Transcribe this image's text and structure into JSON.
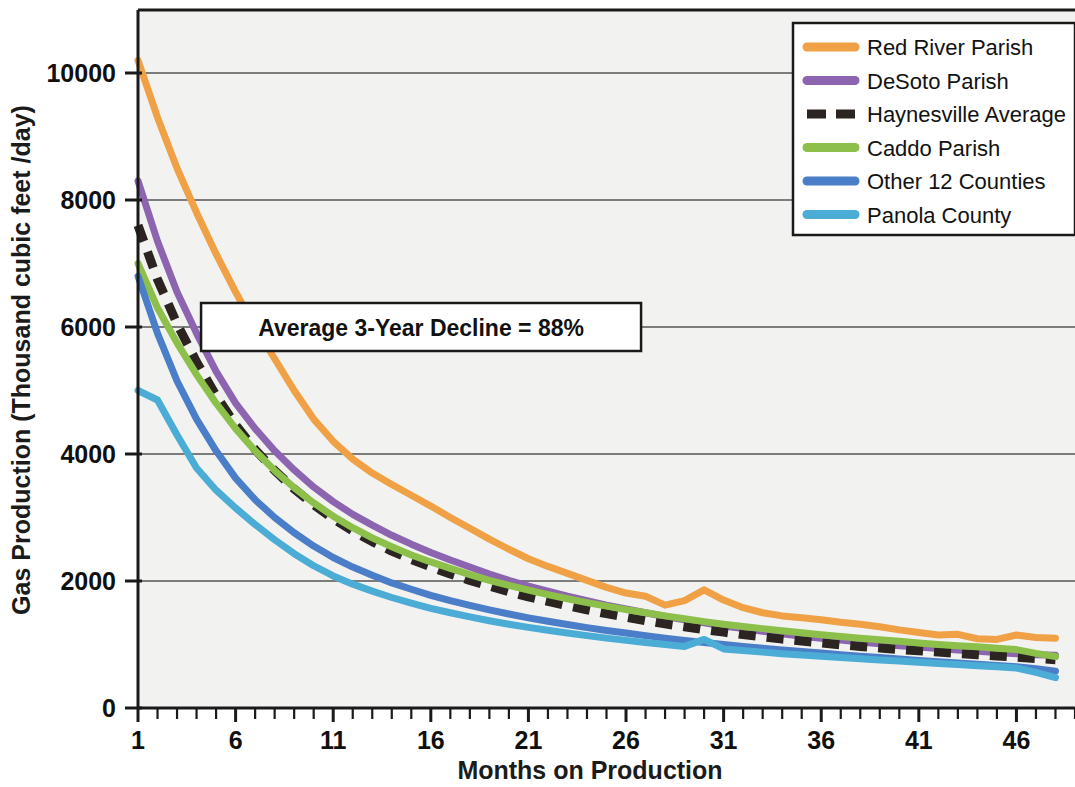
{
  "chart_data": {
    "type": "line",
    "title": "",
    "xlabel": "Months on Production",
    "ylabel": "Gas Production (Thousand cubic feet /day)",
    "xlim": [
      1,
      48
    ],
    "ylim": [
      0,
      10800
    ],
    "xticks": [
      1,
      6,
      11,
      16,
      21,
      26,
      31,
      36,
      41,
      46
    ],
    "xtick_labels": [
      "1",
      "6",
      "11",
      "16",
      "21",
      "26",
      "31",
      "36",
      "41",
      "46"
    ],
    "yticks": [
      0,
      2000,
      4000,
      6000,
      8000,
      10000
    ],
    "ytick_labels": [
      "0",
      "2000",
      "4000",
      "6000",
      "8000",
      "10000"
    ],
    "grid": "horizontal",
    "legend_position": "top-right",
    "x": [
      1,
      2,
      3,
      4,
      5,
      6,
      7,
      8,
      9,
      10,
      11,
      12,
      13,
      14,
      15,
      16,
      17,
      18,
      19,
      20,
      21,
      22,
      23,
      24,
      25,
      26,
      27,
      28,
      29,
      30,
      31,
      32,
      33,
      34,
      35,
      36,
      37,
      38,
      39,
      40,
      41,
      42,
      43,
      44,
      45,
      46,
      47,
      48
    ],
    "series": [
      {
        "name": "Red River Parish",
        "color": "#F0A045",
        "style": "solid",
        "values": [
          10200,
          9300,
          8500,
          7800,
          7150,
          6550,
          6000,
          5500,
          5000,
          4550,
          4200,
          3920,
          3700,
          3520,
          3350,
          3180,
          3000,
          2830,
          2660,
          2500,
          2350,
          2230,
          2120,
          2010,
          1900,
          1810,
          1760,
          1620,
          1690,
          1860,
          1700,
          1580,
          1500,
          1450,
          1420,
          1390,
          1350,
          1320,
          1280,
          1230,
          1190,
          1150,
          1160,
          1090,
          1080,
          1150,
          1110,
          1100
        ]
      },
      {
        "name": "DeSoto Parish",
        "color": "#8C64B0",
        "style": "solid",
        "values": [
          8300,
          7350,
          6550,
          5900,
          5300,
          4800,
          4400,
          4050,
          3750,
          3480,
          3250,
          3050,
          2880,
          2720,
          2580,
          2450,
          2330,
          2220,
          2110,
          2010,
          1920,
          1840,
          1760,
          1690,
          1620,
          1560,
          1500,
          1440,
          1390,
          1340,
          1290,
          1250,
          1210,
          1170,
          1130,
          1100,
          1070,
          1040,
          1010,
          980,
          960,
          935,
          915,
          895,
          875,
          855,
          840,
          830
        ]
      },
      {
        "name": "Haynesville Average",
        "color": "#2B2420",
        "style": "dashed",
        "values": [
          7600,
          6750,
          6050,
          5450,
          4920,
          4460,
          4070,
          3740,
          3450,
          3200,
          2980,
          2790,
          2620,
          2470,
          2340,
          2220,
          2110,
          2010,
          1920,
          1830,
          1750,
          1680,
          1610,
          1545,
          1485,
          1430,
          1375,
          1325,
          1280,
          1235,
          1195,
          1155,
          1120,
          1085,
          1055,
          1025,
          995,
          970,
          945,
          920,
          900,
          880,
          860,
          840,
          820,
          800,
          780,
          760
        ]
      },
      {
        "name": "Caddo Parish",
        "color": "#8CC04A",
        "style": "solid",
        "values": [
          7000,
          6300,
          5750,
          5250,
          4800,
          4400,
          4050,
          3740,
          3470,
          3230,
          3020,
          2840,
          2680,
          2540,
          2410,
          2300,
          2200,
          2100,
          2010,
          1930,
          1855,
          1785,
          1720,
          1660,
          1605,
          1550,
          1500,
          1450,
          1405,
          1360,
          1320,
          1285,
          1250,
          1215,
          1185,
          1155,
          1125,
          1100,
          1075,
          1050,
          1025,
          1000,
          980,
          965,
          940,
          920,
          860,
          810
        ]
      },
      {
        "name": "Other 12 Counties",
        "color": "#4A7EC8",
        "style": "solid",
        "values": [
          6800,
          5900,
          5150,
          4550,
          4050,
          3620,
          3280,
          3000,
          2760,
          2550,
          2370,
          2220,
          2090,
          1970,
          1870,
          1775,
          1690,
          1615,
          1545,
          1480,
          1420,
          1365,
          1315,
          1265,
          1220,
          1180,
          1140,
          1100,
          1065,
          1030,
          1000,
          970,
          940,
          915,
          890,
          865,
          840,
          815,
          795,
          770,
          750,
          730,
          710,
          690,
          670,
          650,
          620,
          580
        ]
      },
      {
        "name": "Panola County",
        "color": "#4BACD6",
        "style": "solid",
        "values": [
          5000,
          4850,
          4300,
          3780,
          3430,
          3150,
          2890,
          2650,
          2430,
          2240,
          2080,
          1950,
          1840,
          1740,
          1650,
          1570,
          1500,
          1435,
          1375,
          1320,
          1270,
          1225,
          1180,
          1140,
          1100,
          1065,
          1030,
          1000,
          970,
          1080,
          930,
          905,
          880,
          855,
          835,
          815,
          795,
          775,
          755,
          740,
          720,
          700,
          685,
          665,
          650,
          630,
          560,
          480
        ]
      }
    ],
    "annotations": [
      {
        "text": "Average 3-Year Decline = 88%",
        "x_value": 15.5,
        "y_value": 6000
      }
    ]
  },
  "legend": {
    "entries": [
      {
        "label": "Red River Parish"
      },
      {
        "label": "DeSoto Parish"
      },
      {
        "label": "Haynesville Average"
      },
      {
        "label": "Caddo Parish"
      },
      {
        "label": "Other 12 Counties"
      },
      {
        "label": "Panola County"
      }
    ]
  }
}
